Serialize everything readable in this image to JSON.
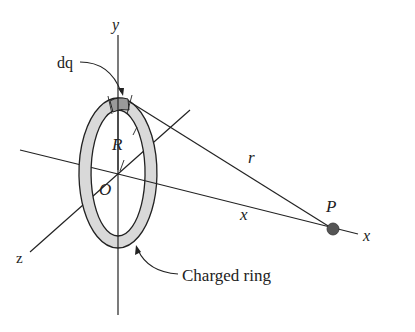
{
  "diagram": {
    "type": "physics-figure",
    "labels": {
      "y_axis": "y",
      "x_axis": "x",
      "z_axis": "z",
      "origin": "O",
      "charge_element": "dq",
      "radius": "R",
      "distance": "r",
      "axial_distance": "x",
      "point": "P",
      "ring": "Charged ring"
    },
    "colors": {
      "line": "#222222",
      "ring_fill": "#d9d9d9",
      "dq_fill": "#9a9a9a",
      "point": "#555555",
      "background": "#ffffff"
    }
  }
}
